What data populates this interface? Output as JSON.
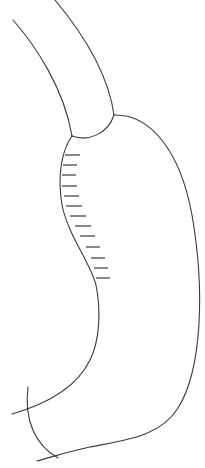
{
  "diagram": {
    "type": "anatomical-line-drawing",
    "canvas": {
      "width": 205,
      "height": 468,
      "background": "#ffffff"
    },
    "stroke": {
      "color": "#3a3a3a",
      "width": 1.1,
      "hatch_width": 1.2
    },
    "esophagus": {
      "left_wall": "M13,20 C35,45 64,88 72,136",
      "right_wall": "M55,0 C80,30 108,72 114,115",
      "junction_arc": "M72,136 C88,142 108,134 114,115"
    },
    "stomach": {
      "greater_curvature": "M114,115 C150,114 180,150 192,215 C205,290 202,370 178,408 C160,437 125,440 90,447 C70,451 52,457 37,461",
      "lesser_curvature": "M72,136 C62,150 57,175 62,205 C68,235 90,262 96,285 C101,310 100,340 90,360 C78,385 50,403 12,414",
      "crossing_arc": "M28,387 C24,420 35,445 58,458"
    },
    "hatch_marks": [
      {
        "x1": 65,
        "y1": 155,
        "x2": 80,
        "y2": 155
      },
      {
        "x1": 63,
        "y1": 165,
        "x2": 77,
        "y2": 165
      },
      {
        "x1": 62,
        "y1": 175,
        "x2": 76,
        "y2": 175
      },
      {
        "x1": 62,
        "y1": 186,
        "x2": 77,
        "y2": 186
      },
      {
        "x1": 64,
        "y1": 196,
        "x2": 79,
        "y2": 196
      },
      {
        "x1": 66,
        "y1": 206,
        "x2": 82,
        "y2": 206
      },
      {
        "x1": 70,
        "y1": 216,
        "x2": 86,
        "y2": 216
      },
      {
        "x1": 75,
        "y1": 226,
        "x2": 91,
        "y2": 226
      },
      {
        "x1": 80,
        "y1": 236,
        "x2": 95,
        "y2": 236
      },
      {
        "x1": 86,
        "y1": 247,
        "x2": 100,
        "y2": 247
      },
      {
        "x1": 91,
        "y1": 258,
        "x2": 105,
        "y2": 258
      },
      {
        "x1": 94,
        "y1": 268,
        "x2": 108,
        "y2": 268
      },
      {
        "x1": 96,
        "y1": 278,
        "x2": 110,
        "y2": 278
      }
    ]
  }
}
